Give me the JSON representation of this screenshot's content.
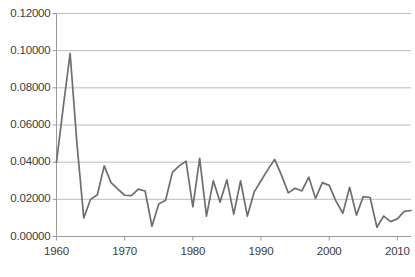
{
  "chart_data": {
    "type": "line",
    "title": "",
    "subtitle": "",
    "xlabel": "",
    "ylabel": "",
    "xlim": [
      1960,
      2012
    ],
    "ylim": [
      0.0,
      0.12
    ],
    "grid": true,
    "grid_axis": "y",
    "legend": false,
    "legend_position": "none",
    "line_color": "#6e6e6e",
    "axis_color": "#9a9a9a",
    "grid_color": "#b5b5b5",
    "background_color": "#ffffff",
    "ytick_labels": [
      "0.00000",
      "0.02000",
      "0.04000",
      "0.06000",
      "0.08000",
      "0.10000",
      "0.12000"
    ],
    "ytick_values": [
      0.0,
      0.02,
      0.04,
      0.06,
      0.08,
      0.1,
      0.12
    ],
    "xtick_labels": [
      "1960",
      "1970",
      "1980",
      "1990",
      "2000",
      "2010"
    ],
    "xtick_values": [
      1960,
      1970,
      1980,
      1990,
      2000,
      2010
    ],
    "series": [
      {
        "name": "series-1",
        "x": [
          1960,
          1961,
          1962,
          1963,
          1964,
          1965,
          1966,
          1967,
          1968,
          1969,
          1970,
          1971,
          1972,
          1973,
          1974,
          1975,
          1976,
          1977,
          1978,
          1979,
          1980,
          1981,
          1982,
          1983,
          1984,
          1985,
          1986,
          1987,
          1988,
          1989,
          1990,
          1991,
          1992,
          1993,
          1994,
          1995,
          1996,
          1997,
          1998,
          1999,
          2000,
          2001,
          2002,
          2003,
          2004,
          2005,
          2006,
          2007,
          2008,
          2009,
          2010,
          2011,
          2012
        ],
        "values": [
          0.04,
          0.07,
          0.0985,
          0.05,
          0.01,
          0.02,
          0.0225,
          0.038,
          0.029,
          0.0255,
          0.0222,
          0.022,
          0.0255,
          0.0245,
          0.0055,
          0.0175,
          0.0195,
          0.0345,
          0.038,
          0.0405,
          0.016,
          0.042,
          0.011,
          0.03,
          0.0185,
          0.0305,
          0.012,
          0.03,
          0.011,
          0.024,
          0.03,
          0.036,
          0.0415,
          0.033,
          0.0235,
          0.026,
          0.0245,
          0.032,
          0.0205,
          0.029,
          0.0275,
          0.019,
          0.0125,
          0.0265,
          0.0115,
          0.0215,
          0.021,
          0.005,
          0.011,
          0.008,
          0.0095,
          0.0135,
          0.014
        ]
      }
    ]
  }
}
